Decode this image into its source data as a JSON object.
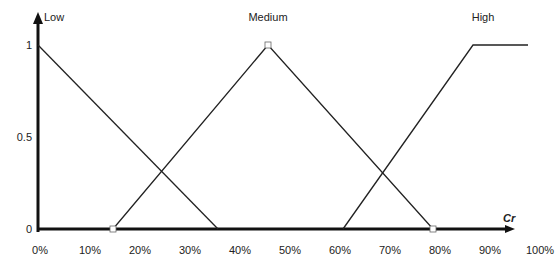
{
  "chart_data": {
    "type": "line",
    "title": "",
    "xlabel": "Cr",
    "ylabel": "",
    "xlim": [
      0,
      100
    ],
    "ylim": [
      0,
      1
    ],
    "x_ticks": [
      "0%",
      "10%",
      "20%",
      "30%",
      "40%",
      "50%",
      "60%",
      "70%",
      "80%",
      "90%",
      "100%"
    ],
    "y_ticks": [
      "0",
      "0.5",
      "1"
    ],
    "grid": false,
    "legend": "inline labels",
    "series": [
      {
        "name": "Low",
        "x": [
          0,
          36
        ],
        "y": [
          1,
          0
        ]
      },
      {
        "name": "Medium",
        "x": [
          15,
          46,
          79
        ],
        "y": [
          0,
          1,
          0
        ]
      },
      {
        "name": "High",
        "x": [
          61,
          87,
          98
        ],
        "y": [
          0,
          1,
          1
        ]
      }
    ],
    "markers": [
      {
        "x": 15,
        "y": 0,
        "shape": "square"
      },
      {
        "x": 46,
        "y": 1,
        "shape": "square"
      },
      {
        "x": 79,
        "y": 0,
        "shape": "square"
      }
    ]
  }
}
